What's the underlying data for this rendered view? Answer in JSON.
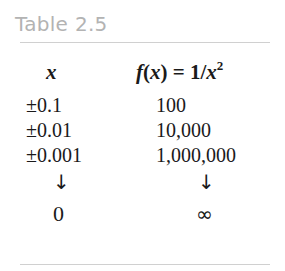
{
  "table": {
    "title": "Table 2.5",
    "header": {
      "col1": "x",
      "col2": {
        "fx": "f",
        "open_paren": "(",
        "arg": "x",
        "close_paren": ")",
        "equals": " = ",
        "numerator": "1/",
        "var": "x",
        "exponent": "2"
      }
    },
    "rows": [
      {
        "x": "±0.1",
        "fx": "100"
      },
      {
        "x": "±0.01",
        "fx": "10,000"
      },
      {
        "x": "±0.001",
        "fx": "1,000,000"
      }
    ],
    "arrows": {
      "col1": "↓",
      "col2": "↓"
    },
    "limit": {
      "x": "0",
      "fx": "∞"
    }
  }
}
